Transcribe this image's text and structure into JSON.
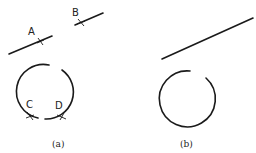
{
  "figure": {
    "panels": [
      {
        "id": "a",
        "caption": "(a)",
        "elements": [
          "line",
          "line",
          "broken-circle"
        ],
        "points": [
          {
            "label": "A"
          },
          {
            "label": "B"
          },
          {
            "label": "C"
          },
          {
            "label": "D"
          }
        ]
      },
      {
        "id": "b",
        "caption": "(b)",
        "elements": [
          "line",
          "broken-circle"
        ]
      }
    ],
    "colors": {
      "ink": "#1a1a1a",
      "background": "#ffffff"
    }
  }
}
